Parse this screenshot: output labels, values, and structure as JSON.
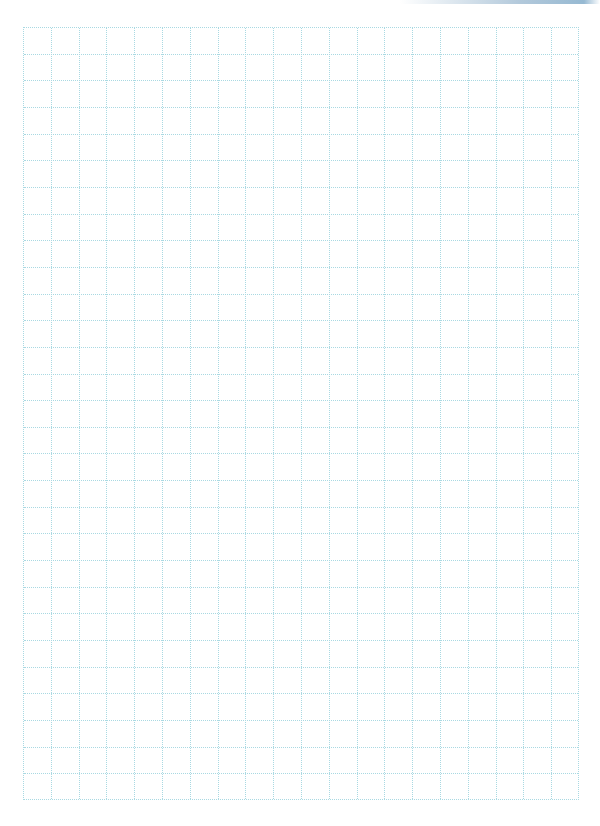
{
  "page": {
    "type": "graph-paper-sheet",
    "background_color": "#ffffff",
    "grid_line_color": "#a9d9e2",
    "grid_line_style": "dotted"
  },
  "grid": {
    "columns": 20,
    "rows": 29,
    "left": 23,
    "top": 27,
    "width": 556,
    "height": 773
  }
}
